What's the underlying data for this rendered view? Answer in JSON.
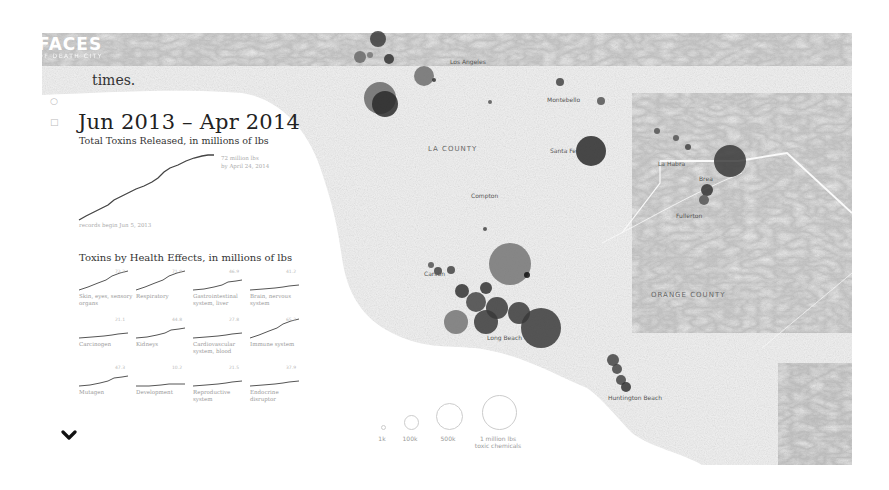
{
  "logo": {
    "line1": "FACES",
    "line2": "OF DEATH CITY"
  },
  "intro_fragment": "times.",
  "side_icons": [
    "twitter-icon",
    "facebook-icon"
  ],
  "period_title": "Jun 2013 – Apr 2014",
  "total_chart": {
    "title": "Total Toxins Released, in millions of lbs",
    "end_label": "72 million lbs\nby April 24, 2014",
    "start_label": "records begin Jun 5, 2013"
  },
  "health": {
    "title": "Toxins by Health Effects, in millions of lbs",
    "items": [
      {
        "label": "Skin, eyes, sensory organs",
        "value": "72.3",
        "slope": "high"
      },
      {
        "label": "Respiratory",
        "value": "71.9",
        "slope": "high"
      },
      {
        "label": "Gastrointestinal system, liver",
        "value": "46.9",
        "slope": "mid"
      },
      {
        "label": "Brain, nervous system",
        "value": "41.2",
        "slope": "low"
      },
      {
        "label": "Carcinogen",
        "value": "21.1",
        "slope": "low"
      },
      {
        "label": "Kidneys",
        "value": "44.8",
        "slope": "mid"
      },
      {
        "label": "Cardiovascular system, blood",
        "value": "27.8",
        "slope": "low"
      },
      {
        "label": "Immune system",
        "value": "65.2",
        "slope": "high"
      },
      {
        "label": "Mutagen",
        "value": "47.3",
        "slope": "mid"
      },
      {
        "label": "Development",
        "value": "10.2",
        "slope": "flat"
      },
      {
        "label": "Reproductive system",
        "value": "21.5",
        "slope": "low"
      },
      {
        "label": "Endocrine disruptor",
        "value": "37.9",
        "slope": "low"
      }
    ]
  },
  "map": {
    "places": [
      {
        "name": "Los Angeles",
        "x": 450,
        "y": 58
      },
      {
        "name": "Montebello",
        "x": 547,
        "y": 96
      },
      {
        "name": "LA COUNTY",
        "x": 428,
        "y": 145,
        "county": true
      },
      {
        "name": "Santa Fe",
        "x": 550,
        "y": 147
      },
      {
        "name": "La Habra",
        "x": 658,
        "y": 160
      },
      {
        "name": "Brea",
        "x": 699,
        "y": 175
      },
      {
        "name": "Fullerton",
        "x": 676,
        "y": 212
      },
      {
        "name": "Compton",
        "x": 471,
        "y": 192
      },
      {
        "name": "Carson",
        "x": 424,
        "y": 270
      },
      {
        "name": "Long Beach",
        "x": 487,
        "y": 334
      },
      {
        "name": "ORANGE COUNTY",
        "x": 651,
        "y": 291,
        "county": true
      },
      {
        "name": "Huntington Beach",
        "x": 608,
        "y": 394
      }
    ],
    "bubbles": [
      {
        "x": 378,
        "y": 39,
        "r": 8,
        "c": "#3c3c3c"
      },
      {
        "x": 360,
        "y": 57,
        "r": 6,
        "c": "#6a6a6a"
      },
      {
        "x": 370,
        "y": 55,
        "r": 3,
        "c": "#777"
      },
      {
        "x": 389,
        "y": 59,
        "r": 5,
        "c": "#333"
      },
      {
        "x": 380,
        "y": 98,
        "r": 16,
        "c": "#6a6a6a"
      },
      {
        "x": 385,
        "y": 104,
        "r": 13,
        "c": "#2a2a2a"
      },
      {
        "x": 424,
        "y": 76,
        "r": 10,
        "c": "#6d6d6d"
      },
      {
        "x": 434,
        "y": 80,
        "r": 2,
        "c": "#333"
      },
      {
        "x": 490,
        "y": 102,
        "r": 2,
        "c": "#555"
      },
      {
        "x": 560,
        "y": 82,
        "r": 4,
        "c": "#444"
      },
      {
        "x": 601,
        "y": 101,
        "r": 4,
        "c": "#555"
      },
      {
        "x": 591,
        "y": 151,
        "r": 15,
        "c": "#2a2a2a"
      },
      {
        "x": 657,
        "y": 131,
        "r": 3,
        "c": "#555"
      },
      {
        "x": 676,
        "y": 138,
        "r": 3,
        "c": "#555"
      },
      {
        "x": 688,
        "y": 147,
        "r": 3,
        "c": "#444"
      },
      {
        "x": 730,
        "y": 161,
        "r": 16,
        "c": "#3a3a3a"
      },
      {
        "x": 707,
        "y": 190,
        "r": 6,
        "c": "#333"
      },
      {
        "x": 704,
        "y": 200,
        "r": 5,
        "c": "#555"
      },
      {
        "x": 485,
        "y": 229,
        "r": 2,
        "c": "#444"
      },
      {
        "x": 510,
        "y": 264,
        "r": 21,
        "c": "#747474"
      },
      {
        "x": 527,
        "y": 275,
        "r": 3,
        "c": "#111"
      },
      {
        "x": 431,
        "y": 265,
        "r": 3,
        "c": "#555"
      },
      {
        "x": 438,
        "y": 271,
        "r": 4,
        "c": "#444"
      },
      {
        "x": 451,
        "y": 270,
        "r": 4,
        "c": "#444"
      },
      {
        "x": 462,
        "y": 291,
        "r": 7,
        "c": "#333"
      },
      {
        "x": 486,
        "y": 288,
        "r": 6,
        "c": "#333"
      },
      {
        "x": 476,
        "y": 302,
        "r": 10,
        "c": "#444"
      },
      {
        "x": 497,
        "y": 308,
        "r": 11,
        "c": "#3a3a3a"
      },
      {
        "x": 519,
        "y": 313,
        "r": 11,
        "c": "#3a3a3a"
      },
      {
        "x": 456,
        "y": 322,
        "r": 12,
        "c": "#747474"
      },
      {
        "x": 486,
        "y": 322,
        "r": 12,
        "c": "#3a3a3a"
      },
      {
        "x": 541,
        "y": 328,
        "r": 20,
        "c": "#3a3a3a"
      },
      {
        "x": 613,
        "y": 360,
        "r": 6,
        "c": "#444"
      },
      {
        "x": 617,
        "y": 369,
        "r": 5,
        "c": "#444"
      },
      {
        "x": 621,
        "y": 380,
        "r": 5,
        "c": "#444"
      },
      {
        "x": 626,
        "y": 387,
        "r": 5,
        "c": "#333"
      }
    ]
  },
  "legend": {
    "items": [
      {
        "label": "1k",
        "size": 3
      },
      {
        "label": "100k",
        "size": 13
      },
      {
        "label": "500k",
        "size": 25
      },
      {
        "label": "1 million lbs\ntoxic chemicals",
        "size": 33
      }
    ]
  }
}
